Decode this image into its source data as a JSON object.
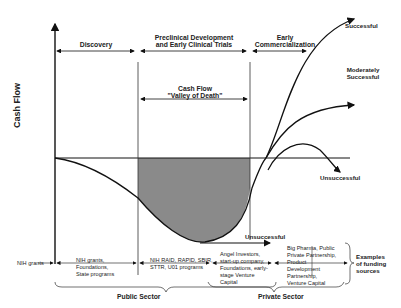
{
  "diagram": {
    "y_axis_label": "Cash Flow",
    "phases": [
      {
        "label": "Discovery"
      },
      {
        "label_line1": "Preclinical Development",
        "label_line2": "and Early Clinical Trials"
      },
      {
        "label_line1": "Early",
        "label_line2": "Commercialization"
      }
    ],
    "valley": {
      "line1": "Cash Flow",
      "line2": "\"Valley of Death\""
    },
    "outcomes": {
      "successful": "Successful",
      "moderate_line1": "Moderately",
      "moderate_line2": "Successful",
      "unsuccessful_right": "Unsuccessful",
      "unsuccessful_bottom": "Unsuccessful"
    },
    "funding": {
      "start_label": "NIH grants",
      "discovery": [
        "NIH grants,",
        "Foundations,",
        "State programs"
      ],
      "preclinical": [
        "NIH RAID, RAPID, SBIR,",
        "STTR, U01 programs"
      ],
      "early": [
        "Angel Investors,",
        "start-up company,",
        "Foundations, early-",
        "stage Venture",
        "Capital"
      ],
      "late": [
        "Big Pharma, Public",
        "Private Partnership,",
        "Product",
        "Development",
        "Partnership,",
        "Venture Capital"
      ],
      "examples": [
        "Examples",
        "of funding",
        "sources"
      ]
    },
    "sectors": {
      "public": "Public Sector",
      "private": "Private Sector"
    },
    "colors": {
      "valley_fill": "#8a8a8a",
      "line": "#111111"
    }
  }
}
